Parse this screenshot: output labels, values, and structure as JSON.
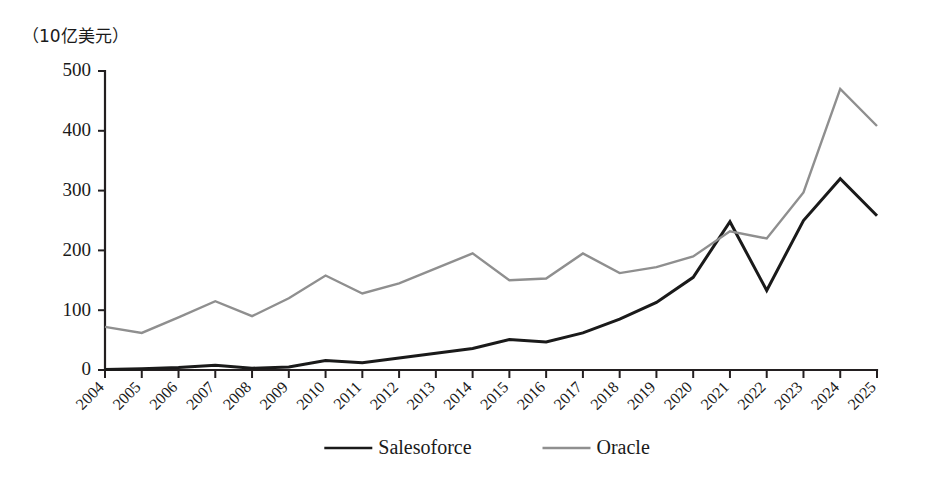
{
  "chart_data": {
    "type": "line",
    "title": "",
    "subtitle": "",
    "unit_label": "（10亿美元）",
    "xlabel": "",
    "ylabel": "",
    "ylim": [
      0,
      500
    ],
    "yticks": [
      0,
      100,
      200,
      300,
      400,
      500
    ],
    "ytick_labels": [
      "0",
      "100",
      "200",
      "300",
      "400",
      "500"
    ],
    "grid": false,
    "legend_position": "bottom-center",
    "categories": [
      "2004",
      "2005",
      "2006",
      "2007",
      "2008",
      "2009",
      "2010",
      "2011",
      "2012",
      "2013",
      "2014",
      "2015",
      "2016",
      "2017",
      "2018",
      "2019",
      "2020",
      "2021",
      "2022",
      "2023",
      "2024",
      "2025"
    ],
    "series": [
      {
        "name": "Salesoforce",
        "color": "#1a1a1a",
        "width": 3.0,
        "values": [
          1,
          2,
          4,
          8,
          3,
          5,
          16,
          12,
          20,
          28,
          36,
          51,
          47,
          62,
          85,
          113,
          155,
          248,
          133,
          250,
          320,
          258
        ]
      },
      {
        "name": "Oracle",
        "color": "#8f8f8f",
        "width": 2.4,
        "values": [
          72,
          62,
          88,
          115,
          90,
          120,
          158,
          128,
          145,
          170,
          195,
          150,
          153,
          195,
          162,
          172,
          190,
          232,
          220,
          297,
          470,
          408
        ]
      }
    ]
  },
  "legend": {
    "items": [
      {
        "label": "Salesoforce",
        "color": "#1a1a1a"
      },
      {
        "label": "Oracle",
        "color": "#8f8f8f"
      }
    ]
  }
}
